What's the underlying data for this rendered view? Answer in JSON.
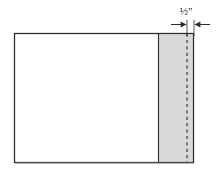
{
  "figure": {
    "type": "line-drawing",
    "background_color": "#ffffff",
    "outline_color": "#2b2b2b",
    "shading_color": "#d9d9d9",
    "dashed_line_color": "#3a3a3a"
  },
  "sheet": {
    "name": "main-rectangle",
    "x": 14,
    "y": 33,
    "width": 180,
    "height": 130,
    "fill": "#ffffff",
    "stroke": "#2b2b2b"
  },
  "band": {
    "name": "shaded-band",
    "x": 158,
    "y": 33,
    "width": 36,
    "height": 130,
    "fill": "#d9d9d9",
    "stroke": "#2b2b2b"
  },
  "fold_line": {
    "name": "dashed-fold-line",
    "x": 187,
    "y_top": 33,
    "y_bottom": 163,
    "style": "dashed",
    "color": "#3a3a3a"
  },
  "dimension": {
    "label": "½\"",
    "value": "1/2",
    "unit": "inch",
    "label_x": 186,
    "label_y": 15,
    "leader_y": 24,
    "from_x": 187,
    "to_x": 194,
    "arrow_direction": "inward",
    "extension_line_color": "#2b2b2b",
    "extension_top": 20,
    "extension_bottom": 36
  },
  "dimension_parts": {
    "numerator": "1",
    "denominator": "2",
    "inch_mark": "\""
  }
}
